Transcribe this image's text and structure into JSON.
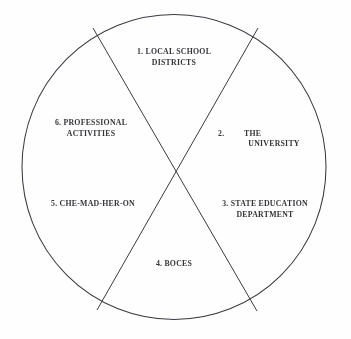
{
  "figure": {
    "type": "circle-partition-diagram",
    "shape": "circle",
    "stroke_color": "#33333a",
    "background_color": "#fefefe",
    "text_color": "#26262b",
    "circle": {
      "cx": 174,
      "cy": 167,
      "r": 152
    },
    "dividers": [
      {
        "name": "divider-line-nw-se",
        "x1": 93,
        "y1": 28,
        "x2": 257,
        "y2": 311
      },
      {
        "name": "divider-line-ne-sw",
        "x1": 258,
        "y1": 28,
        "x2": 97,
        "y2": 310
      }
    ],
    "segments": [
      {
        "number": "1.",
        "label": "1.  LOCAL SCHOOL\nDISTRICTS",
        "name": "segment-local-school-districts",
        "position": "top"
      },
      {
        "number": "2.",
        "label_number": "2.",
        "label_line1": "THE",
        "label_line2": "UNIVERSITY",
        "label": "2.      THE\nUNIVERSITY",
        "name": "segment-the-university",
        "position": "right-upper"
      },
      {
        "number": "3.",
        "label": "3.  STATE EDUCATION\nDEPARTMENT",
        "name": "segment-state-education-department",
        "position": "right-lower"
      },
      {
        "number": "4.",
        "label": "4.  BOCES",
        "name": "segment-boces",
        "position": "bottom"
      },
      {
        "number": "5.",
        "label": "5.  CHE-MAD-HER-ON",
        "name": "segment-che-mad-her-on",
        "position": "left-lower"
      },
      {
        "number": "6.",
        "label": "6.  PROFESSIONAL\nACTIVITIES",
        "name": "segment-professional-activities",
        "position": "left-upper"
      }
    ]
  }
}
